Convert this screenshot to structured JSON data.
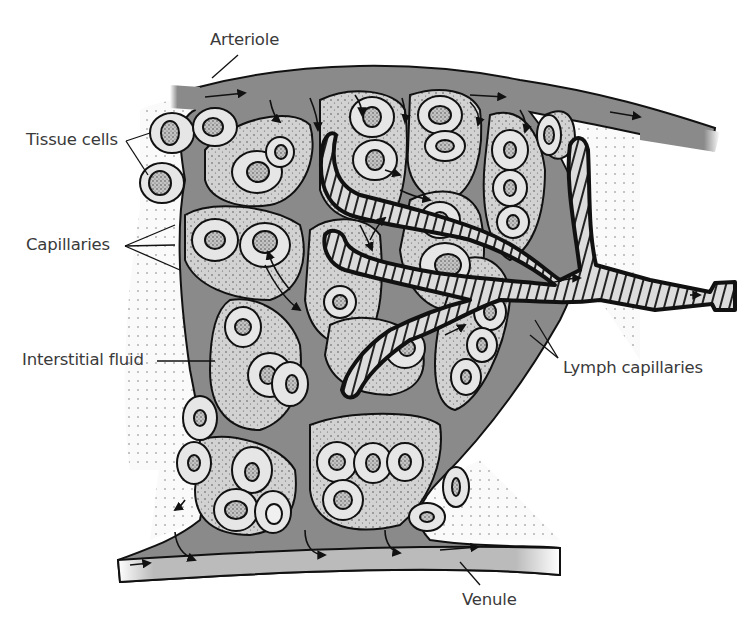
{
  "diagram": {
    "type": "anatomical-illustration",
    "labels": {
      "arteriole": "Arteriole",
      "tissue_cells": "Tissue cells",
      "capillaries": "Capillaries",
      "interstitial_fluid": "Interstitial fluid",
      "lymph_capillaries": "Lymph capillaries",
      "venule": "Venule"
    },
    "colors": {
      "vessel_fill": "#8a8a8a",
      "cell_cluster_fill": "#cfcfcf",
      "cell_fill": "#e6e6e6",
      "nucleus_fill": "#bdbdbd",
      "lymph_fill": "#d9d9d9",
      "outline": "#111111",
      "label_text": "#3a3a3a"
    }
  }
}
